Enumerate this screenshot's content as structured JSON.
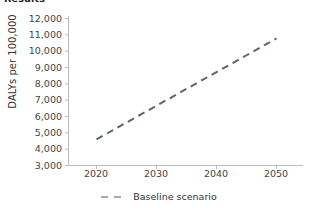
{
  "title_fragment": "Results",
  "chart_data": {
    "type": "line",
    "title": "",
    "xlabel": "",
    "ylabel": "DALYs per 100,000",
    "xlim": [
      2015,
      2054
    ],
    "ylim": [
      3000,
      12000
    ],
    "xticks": [
      2020,
      2030,
      2040,
      2050
    ],
    "xtick_labels": [
      "2020",
      "2030",
      "2040",
      "2050"
    ],
    "yticks": [
      3000,
      4000,
      5000,
      6000,
      7000,
      8000,
      9000,
      10000,
      11000,
      12000
    ],
    "ytick_labels": [
      "3,000",
      "4,000",
      "5,000",
      "6,000",
      "7,000",
      "8,000",
      "9,000",
      "10,000",
      "11,000",
      "12,000"
    ],
    "grid": false,
    "legend_position": "bottom-center",
    "series": [
      {
        "name": "Baseline scenario",
        "style": "dashed",
        "color": "#5b6570",
        "x": [
          2020,
          2025,
          2030,
          2035,
          2040,
          2045,
          2050
        ],
        "values": [
          4600,
          5630,
          6660,
          7690,
          8720,
          9750,
          10780
        ]
      }
    ]
  },
  "legend": {
    "entries": [
      {
        "label": "Baseline scenario",
        "color": "#8a8a8a",
        "style": "dashed"
      }
    ]
  },
  "colors": {
    "line": "#5b6570",
    "axis": "#b9bdc2",
    "tick_text": "#444444",
    "legend_dash": "#8f8f8f",
    "background": "#ffffff"
  }
}
